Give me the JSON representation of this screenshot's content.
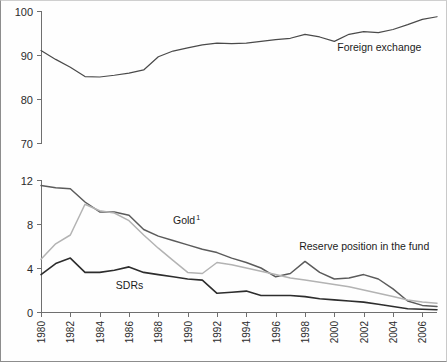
{
  "figure": {
    "background_color": "#ffffff",
    "frame_color": "#8d8d8d"
  },
  "chart_data": [
    {
      "type": "line",
      "id": "top-panel",
      "title": "",
      "xlabel": "",
      "ylabel": "",
      "grid": false,
      "legend_position": "inline-annotation",
      "xlim": [
        1980,
        2007
      ],
      "ylim": [
        70,
        100
      ],
      "yticks": [
        70,
        80,
        90,
        100
      ],
      "ytick_labels": [
        "70",
        "80",
        "90",
        "100"
      ],
      "xticks": [],
      "xtick_labels": [],
      "x": [
        1980,
        1981,
        1982,
        1983,
        1984,
        1985,
        1986,
        1987,
        1988,
        1989,
        1990,
        1991,
        1992,
        1993,
        1994,
        1995,
        1996,
        1997,
        1998,
        1999,
        2000,
        2001,
        2002,
        2003,
        2004,
        2005,
        2006,
        2007
      ],
      "series": [
        {
          "name": "Foreign exchange",
          "color": "#4a4a4a",
          "width": 1.2,
          "label_x": 2000.2,
          "label_y": 91.0,
          "values": [
            91.0,
            89.0,
            87.2,
            85.1,
            85.0,
            85.4,
            85.9,
            86.6,
            89.6,
            90.9,
            91.6,
            92.3,
            92.7,
            92.6,
            92.7,
            93.1,
            93.5,
            93.8,
            94.7,
            94.1,
            93.1,
            94.7,
            95.3,
            95.1,
            95.8,
            96.9,
            98.1,
            98.7
          ]
        }
      ]
    },
    {
      "type": "line",
      "id": "bottom-panel",
      "title": "",
      "xlabel": "",
      "ylabel": "",
      "grid": false,
      "legend_position": "inline-annotation",
      "xlim": [
        1980,
        2007
      ],
      "ylim": [
        0,
        12
      ],
      "yticks": [
        0,
        4,
        8,
        12
      ],
      "ytick_labels": [
        "0",
        "4",
        "8",
        "12"
      ],
      "xticks": [
        1980,
        1982,
        1984,
        1986,
        1988,
        1990,
        1992,
        1994,
        1996,
        1998,
        2000,
        2002,
        2004,
        2006
      ],
      "xtick_labels": [
        "1980",
        "1982",
        "1984",
        "1986",
        "1988",
        "1990",
        "1992",
        "1994",
        "1996",
        "1998",
        "2000",
        "2002",
        "2004",
        "2006"
      ],
      "xtick_rotation": 90,
      "x": [
        1980,
        1981,
        1982,
        1983,
        1984,
        1985,
        1986,
        1987,
        1988,
        1989,
        1990,
        1991,
        1992,
        1993,
        1994,
        1995,
        1996,
        1997,
        1998,
        1999,
        2000,
        2001,
        2002,
        2003,
        2004,
        2005,
        2006,
        2007
      ],
      "series": [
        {
          "name": "Reserve position in the fund",
          "color": "#5b5b5b",
          "width": 1.5,
          "label_x": 1997.6,
          "label_y": 5.65,
          "label_text": "Reserve position in the fund",
          "values": [
            11.5,
            11.3,
            11.2,
            10.0,
            9.1,
            9.1,
            8.8,
            7.5,
            6.9,
            6.5,
            6.1,
            5.7,
            5.4,
            4.9,
            4.5,
            4.0,
            3.2,
            3.5,
            4.6,
            3.6,
            3.0,
            3.1,
            3.4,
            3.0,
            2.1,
            1.0,
            0.6,
            0.5
          ]
        },
        {
          "name": "Gold",
          "footnote": "1",
          "color": "#b3b3b3",
          "width": 1.5,
          "label_x": 1989.0,
          "label_y": 8.0,
          "label_text": "Gold",
          "values": [
            4.8,
            6.2,
            7.0,
            9.8,
            9.2,
            9.0,
            8.3,
            7.0,
            5.8,
            4.7,
            3.6,
            3.5,
            4.5,
            4.3,
            4.0,
            3.7,
            3.4,
            3.1,
            2.9,
            2.7,
            2.5,
            2.3,
            2.0,
            1.7,
            1.4,
            1.1,
            0.9,
            0.8
          ]
        },
        {
          "name": "SDRs",
          "color": "#2d2d2d",
          "width": 1.6,
          "label_x": 1985.1,
          "label_y": 2.05,
          "label_text": "SDRs",
          "values": [
            3.4,
            4.4,
            4.9,
            3.6,
            3.6,
            3.8,
            4.1,
            3.6,
            3.4,
            3.2,
            3.0,
            2.9,
            1.7,
            1.8,
            1.9,
            1.5,
            1.5,
            1.5,
            1.4,
            1.2,
            1.1,
            1.0,
            0.9,
            0.7,
            0.5,
            0.3,
            0.25,
            0.2
          ]
        }
      ]
    }
  ]
}
